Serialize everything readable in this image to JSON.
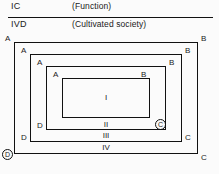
{
  "header": {
    "rows": [
      {
        "key": "IC",
        "value": "(Function)"
      },
      {
        "key": "IVD",
        "value": "(Cultivated society)"
      }
    ]
  },
  "diagram": {
    "rings": [
      {
        "roman": "IV",
        "corners": {
          "top_left": "A",
          "top_right": "B",
          "bottom_right": "C",
          "bottom_left": "D"
        },
        "bottom_left_circled": true,
        "bottom_right_circled": false
      },
      {
        "roman": "III",
        "corners": {
          "top_left": "A",
          "top_right": "B",
          "bottom_right": "C",
          "bottom_left": "D"
        },
        "bottom_left_circled": false,
        "bottom_right_circled": false
      },
      {
        "roman": "II",
        "corners": {
          "top_left": "A",
          "top_right": "B",
          "bottom_right": "C",
          "bottom_left": "D"
        },
        "bottom_left_circled": false,
        "bottom_right_circled": true
      },
      {
        "roman": "I",
        "corners": {
          "top_left": "A",
          "top_right": "B",
          "bottom_right": "",
          "bottom_left": ""
        },
        "bottom_left_circled": false,
        "bottom_right_circled": false
      }
    ]
  },
  "colors": {
    "ink": "#111111",
    "paper": "#fbfbfb"
  }
}
